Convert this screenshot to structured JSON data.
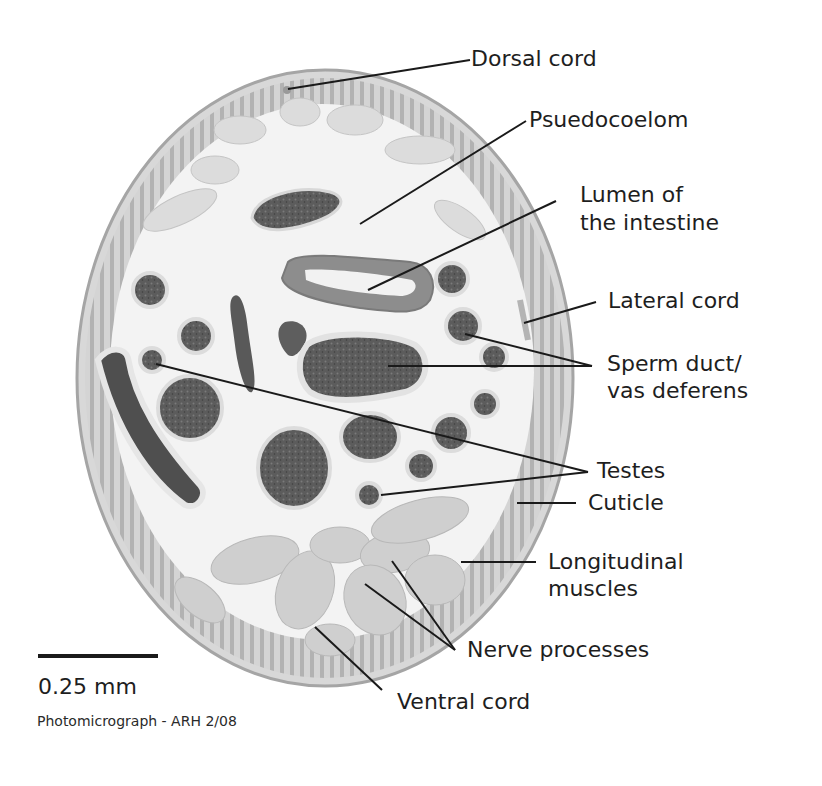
{
  "figure": {
    "labels": {
      "dorsal_cord": "Dorsal cord",
      "pseudocoelom": "Psuedocoelom",
      "lumen_line1": "Lumen of",
      "lumen_line2": "the intestine",
      "lateral_cord": "Lateral cord",
      "sperm_duct_line1": "Sperm duct/",
      "sperm_duct_line2": "vas deferens",
      "testes": "Testes",
      "cuticle": "Cuticle",
      "longitudinal_line1": "Longitudinal",
      "longitudinal_line2": "muscles",
      "nerve_processes": "Nerve processes",
      "ventral_cord": "Ventral cord"
    },
    "scale_bar": {
      "label": "0.25 mm"
    },
    "credit": "Photomicrograph - ARH 2/08"
  },
  "colors": {
    "background": "#ffffff",
    "body_fill": "#e6e6e6",
    "cuticle": "#a9a9a9",
    "muscle_band": "#c8c8c8",
    "pseudocoelom": "#f4f4f4",
    "dark_tissue": "#5a5a5a",
    "leader_line": "#1a1a1a",
    "text": "#1e1e1e"
  }
}
